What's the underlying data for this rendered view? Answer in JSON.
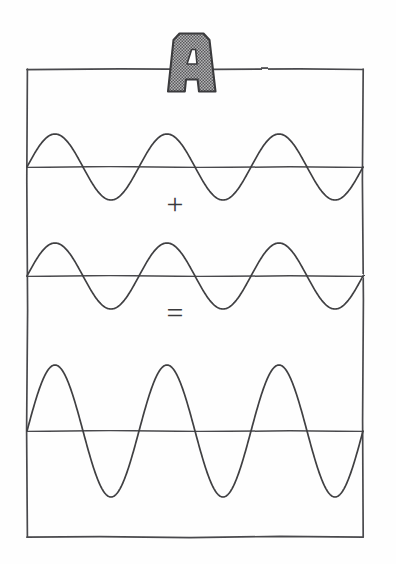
{
  "figure": {
    "title": "Wave superposition (constructive interference)",
    "label_letter": "A",
    "label_letter_name": "letter-a-stipple",
    "operators": {
      "plus": "+",
      "equals": "="
    },
    "colors": {
      "background": "#fefefe",
      "ink": "#3f3f42",
      "frame": "#4a4a4d",
      "letter_fill": "#8c8c8e",
      "letter_outline": "#3a3a3c",
      "letter_stipple": "#5c5c5e"
    },
    "frame": {
      "x": 27,
      "y": 69,
      "width": 336,
      "height": 468
    }
  },
  "chart_data": {
    "type": "line",
    "title": "Wave superposition (constructive interference)",
    "subtitle": "A",
    "xlabel": "",
    "ylabel": "",
    "grid": false,
    "legend": "none",
    "x_range": [
      0,
      3
    ],
    "x_unit": "cycles",
    "panels": [
      {
        "name": "wave-1",
        "role": "addend",
        "operator_after": "+",
        "axis_y_px": 167,
        "amplitude_px": 33,
        "cycles": 3,
        "phase_deg": 0,
        "samples_x": [
          0,
          0.125,
          0.25,
          0.375,
          0.5,
          0.625,
          0.75,
          0.875,
          1
        ],
        "samples_y_normalized": [
          0,
          0.707,
          1,
          0.707,
          0,
          -0.707,
          -1,
          -0.707,
          0
        ]
      },
      {
        "name": "wave-2",
        "role": "addend",
        "operator_after": "=",
        "axis_y_px": 276,
        "amplitude_px": 33,
        "cycles": 3,
        "phase_deg": 0,
        "samples_x": [
          0,
          0.125,
          0.25,
          0.375,
          0.5,
          0.625,
          0.75,
          0.875,
          1
        ],
        "samples_y_normalized": [
          0,
          0.707,
          1,
          0.707,
          0,
          -0.707,
          -1,
          -0.707,
          0
        ]
      },
      {
        "name": "wave-sum",
        "role": "resultant",
        "operator_after": "",
        "axis_y_px": 431,
        "amplitude_px": 66,
        "cycles": 3,
        "phase_deg": 0,
        "samples_x": [
          0,
          0.125,
          0.25,
          0.375,
          0.5,
          0.625,
          0.75,
          0.875,
          1
        ],
        "samples_y_normalized": [
          0,
          0.707,
          1,
          0.707,
          0,
          -0.707,
          -1,
          -0.707,
          0
        ]
      }
    ]
  }
}
